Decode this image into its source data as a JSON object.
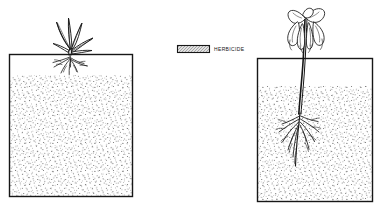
{
  "figure": {
    "background_color": "#ffffff",
    "ink_color": "#171717",
    "soil_stipple_color": "#6e6e6e",
    "width": 390,
    "height": 212
  },
  "legend": {
    "label": "HERBICIDE",
    "swatch_name": "herbicide-swatch",
    "swatch_fill": "#d9d9d9",
    "swatch_border": "#171717"
  },
  "panels": [
    {
      "id": "untreated",
      "name": "untreated-soil-panel",
      "plant_state": "healthy upright seedling",
      "root_state": "short shallow roots",
      "soil_label": "untreated soil",
      "box": {
        "x": 9,
        "y": 54,
        "width": 124,
        "height": 143
      },
      "soil_top": 75
    },
    {
      "id": "treated",
      "name": "herbicide-treated-soil-panel",
      "plant_state": "wilted drooping seedling",
      "root_state": "long spreading roots",
      "soil_label": "herbicide treated soil",
      "box": {
        "x": 257,
        "y": 58,
        "width": 116,
        "height": 144
      },
      "soil_top": 86
    }
  ]
}
